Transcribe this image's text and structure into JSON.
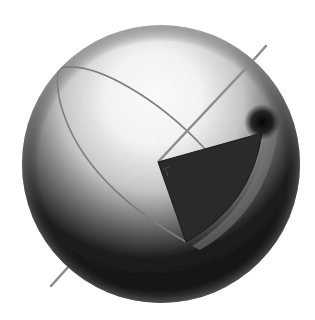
{
  "figure": {
    "kind": "sphere-diagram",
    "canvas": {
      "width": 315,
      "height": 320
    }
  },
  "sphere": {
    "cx": 161,
    "cy": 164,
    "r": 139,
    "highlight_color": "#ffffff",
    "mid_color": "#bdbdbd",
    "shadow_color": "#121212",
    "rim_color": "#8a8a8a"
  },
  "axis": {
    "x1": 51,
    "y1": 286,
    "x2": 266,
    "y2": 46,
    "color": "#8c8c8c",
    "width": 2.5
  },
  "meridian": {
    "color": "#7d7d7d",
    "width": 1.6
  },
  "wedge": {
    "apex": [
      158,
      162
    ],
    "top_corner": [
      262,
      133
    ],
    "bottom_tip": [
      186,
      242
    ],
    "fill": "#2a2a2a",
    "edge_highlight": "#8f8f8f"
  },
  "dark_spot": {
    "cx": 262,
    "cy": 122,
    "r": 16,
    "color": "#0a0a0a"
  },
  "labels": []
}
